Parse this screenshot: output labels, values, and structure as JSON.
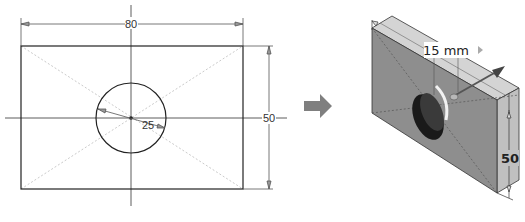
{
  "sketch_2d": {
    "width_dimension": "80",
    "height_dimension": "50",
    "diameter_dimension": "25"
  },
  "transition_arrow": {
    "icon": "right-arrow-icon",
    "color": "#7f7f7f"
  },
  "model_3d": {
    "extrude_distance_label": "15 mm",
    "height_dimension": "50",
    "face_color": "#8c8c8c",
    "top_color": "#d2d2d2",
    "side_color": "#bdbdbd"
  }
}
